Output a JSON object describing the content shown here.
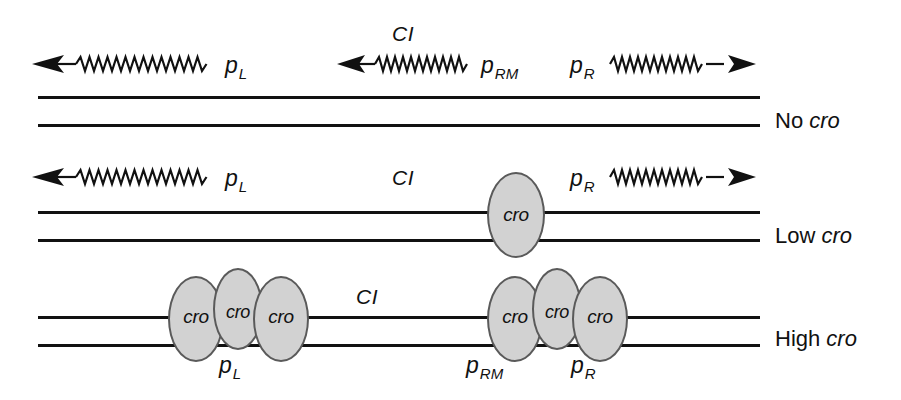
{
  "figure": {
    "colors": {
      "line": "#111111",
      "protein_fill": "#d2d2d2",
      "protein_stroke": "#5a5a5a",
      "background": "#ffffff"
    }
  },
  "labels": {
    "cI": "CI",
    "cro": "cro",
    "pL": "p",
    "pL_sub": "L",
    "pRM": "p",
    "pRM_sub": "RM",
    "pR": "p",
    "pR_sub": "R"
  },
  "rows": [
    {
      "id": "no-cro",
      "row_label_prefix": "No ",
      "row_label_gene": "cro",
      "transcripts": [
        {
          "name": "pL-transcript",
          "direction": "left",
          "label": "p",
          "sub": "L"
        },
        {
          "name": "pRM-transcript",
          "direction": "left",
          "label": "p",
          "sub": "RM"
        },
        {
          "name": "pR-transcript",
          "direction": "right",
          "label": "p",
          "sub": "R"
        }
      ],
      "cI_label": "CI",
      "proteins": []
    },
    {
      "id": "low-cro",
      "row_label_prefix": "Low ",
      "row_label_gene": "cro",
      "transcripts": [
        {
          "name": "pL-transcript",
          "direction": "left",
          "label": "p",
          "sub": "L"
        },
        {
          "name": "pR-transcript",
          "direction": "right",
          "label": "p",
          "sub": "R"
        }
      ],
      "cI_label": "CI",
      "proteins": [
        {
          "name": "cro-protein-pR",
          "text": "cro"
        }
      ]
    },
    {
      "id": "high-cro",
      "row_label_prefix": "High ",
      "row_label_gene": "cro",
      "transcripts": [],
      "cI_label": "CI",
      "proteins": [
        {
          "name": "cro-protein-left-1",
          "text": "cro"
        },
        {
          "name": "cro-protein-left-2",
          "text": "cro"
        },
        {
          "name": "cro-protein-left-3",
          "text": "cro"
        },
        {
          "name": "cro-protein-right-1",
          "text": "cro"
        },
        {
          "name": "cro-protein-right-2",
          "text": "cro"
        },
        {
          "name": "cro-protein-right-3",
          "text": "cro"
        }
      ],
      "promoter_labels": [
        {
          "name": "pL-label",
          "label": "p",
          "sub": "L"
        },
        {
          "name": "pRM-label",
          "label": "p",
          "sub": "RM"
        },
        {
          "name": "pR-label",
          "label": "p",
          "sub": "R"
        }
      ]
    }
  ]
}
